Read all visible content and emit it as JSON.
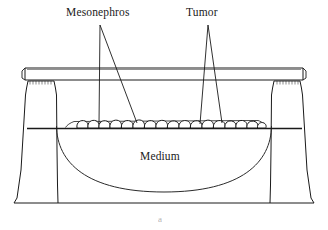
{
  "figure": {
    "domain": "diagram",
    "caption": "a",
    "background_color": "#ffffff",
    "line_color": "#1a1a1a",
    "width": 328,
    "height": 230
  },
  "labels": {
    "mesonephros": "Mesonephros",
    "tumor": "Tumor",
    "medium": "Medium"
  },
  "parts": {
    "lid": "dish-lid",
    "left_wall": "dish-left-wall",
    "right_wall": "dish-right-wall",
    "bowl": "medium-bowl",
    "platform": "support-platform",
    "membrane": "culture-membrane",
    "explants": "tissue-explant-cluster",
    "base": "dish-base"
  },
  "leaders": {
    "mesonephros_count": 2,
    "tumor_count": 2
  },
  "explants": {
    "count": 17,
    "description": "row of rounded tissue explants on the culture membrane"
  }
}
